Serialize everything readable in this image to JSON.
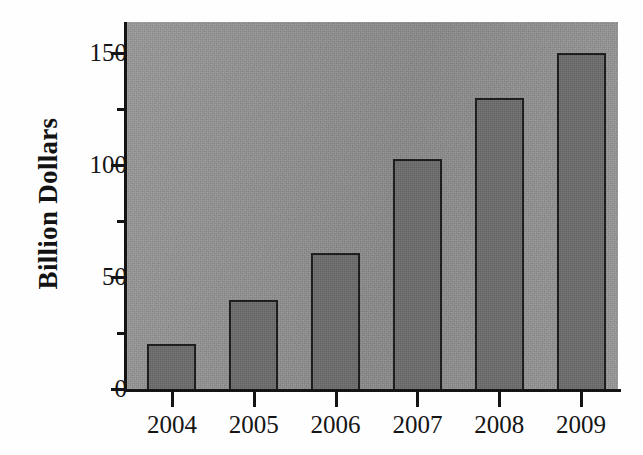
{
  "chart_data": {
    "type": "bar",
    "title": "",
    "xlabel": "",
    "ylabel": "Billion Dollars",
    "categories": [
      "2004",
      "2005",
      "2006",
      "2007",
      "2008",
      "2009"
    ],
    "values": [
      20,
      40,
      61,
      103,
      130,
      150
    ],
    "ylim": [
      0,
      164
    ],
    "ytick_major": [
      0,
      50,
      100,
      150
    ],
    "ytick_minor": [
      25,
      75,
      125
    ],
    "ytick_labels": [
      "0",
      "50",
      "100",
      "150"
    ],
    "grid": false,
    "legend": null,
    "units": "Billion Dollars",
    "colors": {
      "bar_fill": "#6d6d6d",
      "bar_edge": "#1d1d1d",
      "plot_background": "#919191",
      "axis": "#131313",
      "text": "#141414",
      "figure_background": "#ffffff"
    }
  },
  "axes": {
    "y_title": "Billion Dollars",
    "y_labels": [
      "150",
      "100",
      "50",
      "0"
    ],
    "x_labels": [
      "2004",
      "2005",
      "2006",
      "2007",
      "2008",
      "2009"
    ]
  }
}
